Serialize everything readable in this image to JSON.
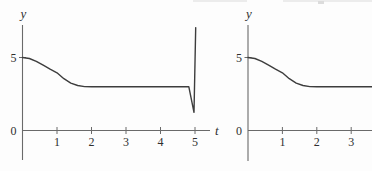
{
  "figure": {
    "description_role": "pair of solution-curve plots",
    "background": "#fdfdfd"
  },
  "colors": {
    "axis": "#6a6a6a",
    "curve": "#3d3d3d",
    "text": "#2f2f2f",
    "artifact": "#ececec"
  },
  "chart_data": [
    {
      "type": "line",
      "title": "",
      "xlabel": "t",
      "ylabel": "y",
      "xticks": [
        1,
        2,
        3,
        4,
        5
      ],
      "yticks": [
        0,
        5
      ],
      "xlim": [
        0,
        5.45
      ],
      "ylim": [
        -2,
        7.2
      ],
      "grid": false,
      "legend": "none",
      "series": [
        {
          "name": "solution-curve-with-terminal-spike",
          "x": [
            0,
            0.2,
            0.4,
            0.6,
            0.8,
            1.0,
            1.2,
            1.4,
            1.6,
            1.8,
            2.0,
            3.0,
            4.0,
            4.82,
            4.97,
            5.02
          ],
          "y": [
            5.0,
            4.93,
            4.73,
            4.47,
            4.2,
            3.95,
            3.55,
            3.25,
            3.08,
            3.01,
            3.0,
            3.0,
            3.0,
            3.0,
            1.25,
            7.05
          ]
        }
      ]
    },
    {
      "type": "line",
      "title": "",
      "xlabel": "",
      "ylabel": "y",
      "xticks": [
        1,
        2,
        3
      ],
      "yticks": [
        0,
        5
      ],
      "xlim": [
        0,
        3.62
      ],
      "ylim": [
        -2,
        7.2
      ],
      "grid": false,
      "legend": "none",
      "series": [
        {
          "name": "smooth-solution-curve",
          "x": [
            0,
            0.2,
            0.4,
            0.6,
            0.8,
            1.0,
            1.2,
            1.4,
            1.6,
            1.8,
            2.0,
            3.0,
            3.62
          ],
          "y": [
            5.0,
            4.93,
            4.73,
            4.47,
            4.2,
            3.95,
            3.55,
            3.25,
            3.08,
            3.01,
            3.0,
            3.0,
            3.0
          ]
        }
      ]
    }
  ]
}
